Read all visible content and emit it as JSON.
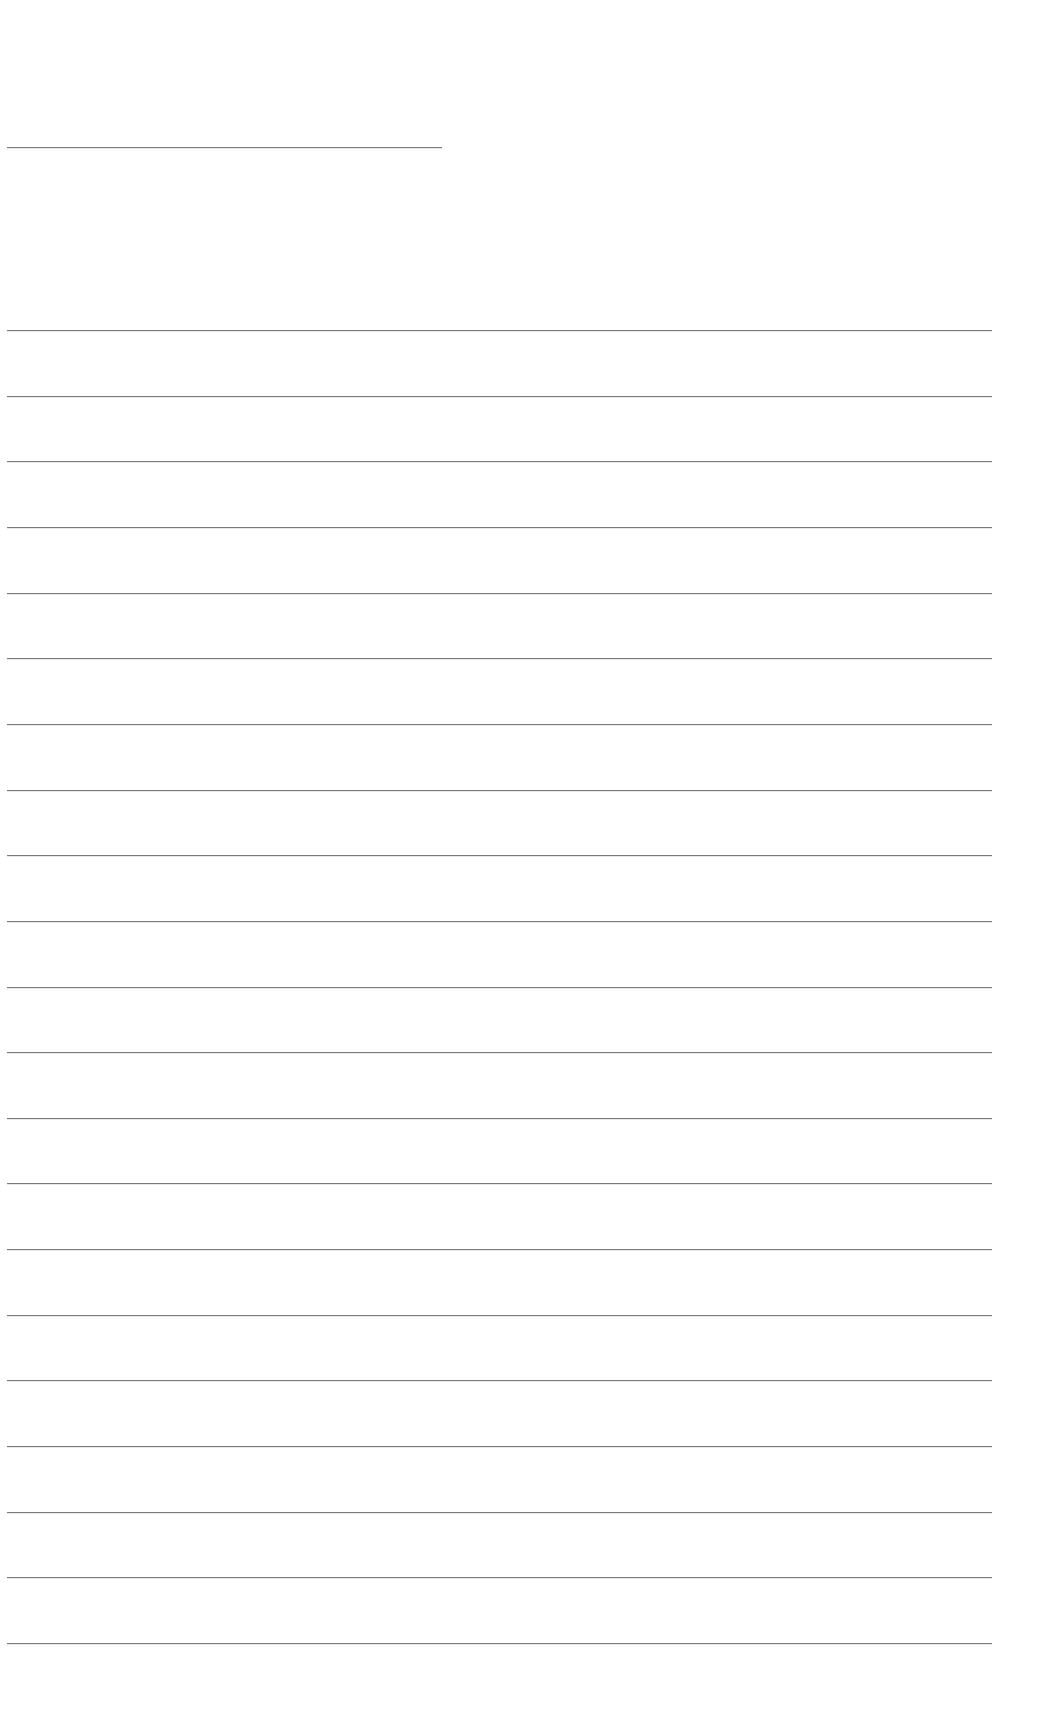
{
  "page": {
    "type": "blank lined writing page",
    "background_color": "#ffffff",
    "line_color": "#7a7a7a",
    "title_line": {
      "left": 7,
      "top": 147,
      "width": 435
    },
    "writing_lines": {
      "count": 21,
      "left": 7,
      "right": 992,
      "first_top": 330,
      "spacing": 65.65
    }
  }
}
